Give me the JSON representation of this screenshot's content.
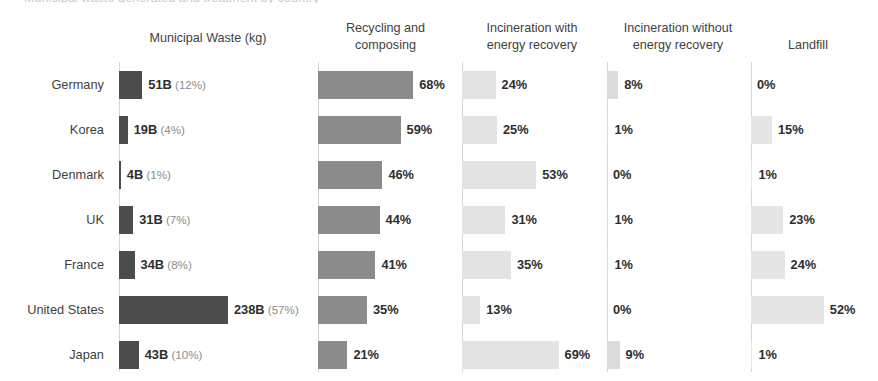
{
  "supertitle": "Municipal waste generated and treatment by country",
  "countries": [
    "Germany",
    "Korea",
    "Denmark",
    "UK",
    "France",
    "United States",
    "Japan"
  ],
  "panels": {
    "waste": {
      "header": "Municipal Waste (kg)"
    },
    "recycle": {
      "header": "Recycling and\ncomposing"
    },
    "incwith": {
      "header": "Incineration with\nenergy recovery"
    },
    "incwout": {
      "header": "Incineration without\nenergy recovery"
    },
    "landfill": {
      "header": "Landfill"
    }
  },
  "colors": {
    "waste_bar": "#4c4c4c",
    "recycle_bar": "#8b8b8b",
    "incineration_with_bar": "#e3e3e3",
    "incineration_without_bar": "#dcdcdc",
    "landfill_bar": "#e6e6e6",
    "axis": "#d6d6d6",
    "text": "#3f3f3f",
    "subtext": "#8c8c8c"
  },
  "chart_data": {
    "type": "bar",
    "title": "Municipal waste generated and treatment by country",
    "xlabel": "",
    "ylabel": "",
    "grid": false,
    "legend": "none",
    "orientation": "horizontal",
    "layout": "small-multiples, 5 panels sharing country rows",
    "categories": [
      "Germany",
      "Korea",
      "Denmark",
      "UK",
      "France",
      "United States",
      "Japan"
    ],
    "panels": [
      {
        "key": "waste",
        "title": "Municipal Waste (kg)",
        "unit": "B",
        "values": [
          51,
          19,
          4,
          31,
          34,
          238,
          43
        ],
        "share_pct": [
          12,
          4,
          1,
          7,
          8,
          57,
          10
        ],
        "labels": [
          {
            "main": "51B",
            "sub": "(12%)"
          },
          {
            "main": "19B",
            "sub": "(4%)"
          },
          {
            "main": "4B",
            "sub": "(1%)"
          },
          {
            "main": "31B",
            "sub": "(7%)"
          },
          {
            "main": "34B",
            "sub": "(8%)"
          },
          {
            "main": "238B",
            "sub": "(57%)"
          },
          {
            "main": "43B",
            "sub": "(10%)"
          }
        ],
        "xlim": [
          0,
          238
        ]
      },
      {
        "key": "recycle",
        "title": "Recycling and composing",
        "unit": "%",
        "values": [
          68,
          59,
          46,
          44,
          41,
          35,
          21
        ],
        "labels": [
          {
            "main": "68%"
          },
          {
            "main": "59%"
          },
          {
            "main": "46%"
          },
          {
            "main": "44%"
          },
          {
            "main": "41%"
          },
          {
            "main": "35%"
          },
          {
            "main": "21%"
          }
        ],
        "xlim": [
          0,
          100
        ]
      },
      {
        "key": "incwith",
        "title": "Incineration with energy recovery",
        "unit": "%",
        "values": [
          24,
          25,
          53,
          31,
          35,
          13,
          69
        ],
        "labels": [
          {
            "main": "24%"
          },
          {
            "main": "25%"
          },
          {
            "main": "53%"
          },
          {
            "main": "31%"
          },
          {
            "main": "35%"
          },
          {
            "main": "13%"
          },
          {
            "main": "69%"
          }
        ],
        "xlim": [
          0,
          100
        ]
      },
      {
        "key": "incwout",
        "title": "Incineration without energy recovery",
        "unit": "%",
        "values": [
          8,
          1,
          0,
          1,
          1,
          0,
          9
        ],
        "labels": [
          {
            "main": "8%"
          },
          {
            "main": "1%"
          },
          {
            "main": "0%"
          },
          {
            "main": "1%"
          },
          {
            "main": "1%"
          },
          {
            "main": "0%"
          },
          {
            "main": "9%"
          }
        ],
        "xlim": [
          0,
          100
        ]
      },
      {
        "key": "landfill",
        "title": "Landfill",
        "unit": "%",
        "values": [
          0,
          15,
          1,
          23,
          24,
          52,
          1
        ],
        "labels": [
          {
            "main": "0%"
          },
          {
            "main": "15%"
          },
          {
            "main": "1%"
          },
          {
            "main": "23%"
          },
          {
            "main": "24%"
          },
          {
            "main": "52%"
          },
          {
            "main": "1%"
          }
        ],
        "xlim": [
          0,
          100
        ]
      }
    ]
  },
  "scales": {
    "waste_px_per_unit": 0.458,
    "pct_px_per_unit": 1.4
  }
}
